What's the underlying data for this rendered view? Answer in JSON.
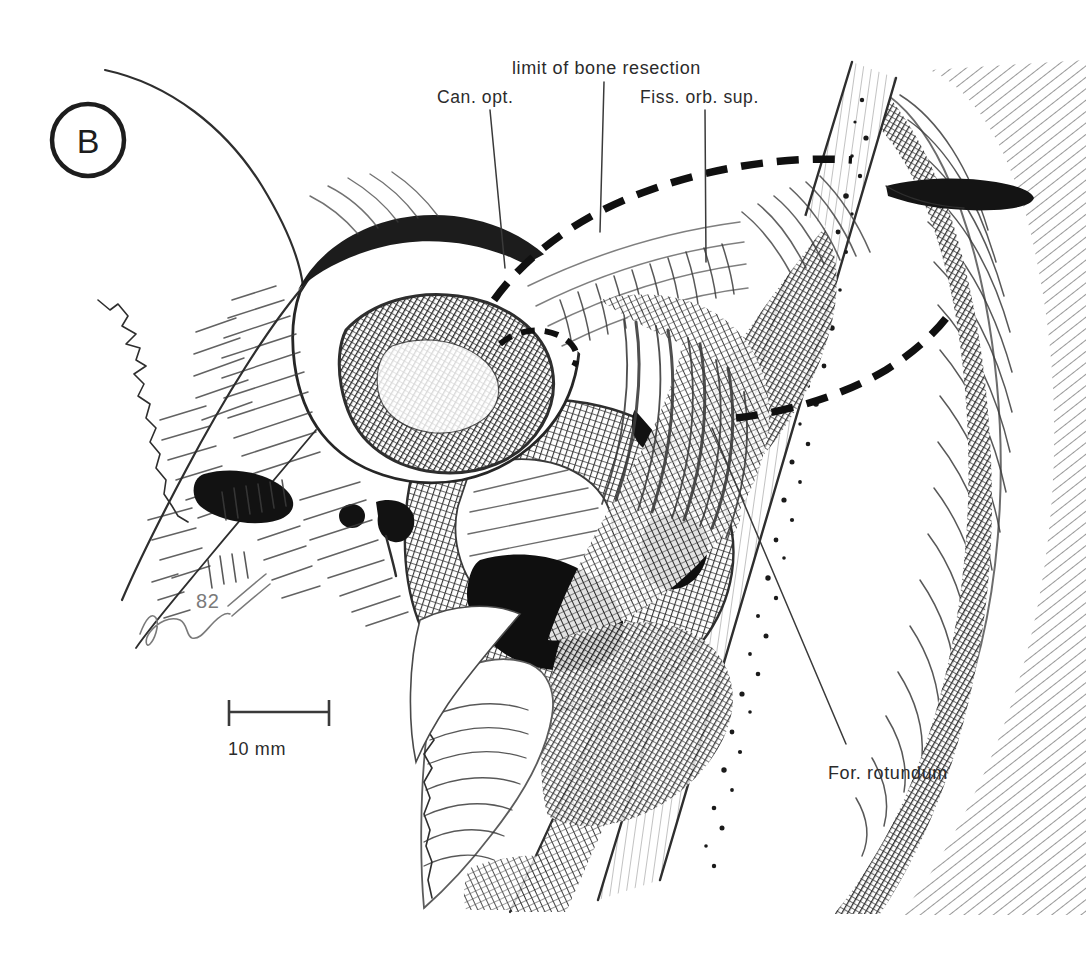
{
  "figure": {
    "panel_letter": "B",
    "type": "anatomical-line-drawing",
    "ink_color": "#1d1d1d",
    "background_color": "#ffffff"
  },
  "labels": {
    "can_opt": "Can. opt.",
    "limit_of_bone_resection": "limit of bone resection",
    "fiss_orb_sup": "Fiss. orb. sup.",
    "for_rotundum": "For. rotundum"
  },
  "scale": {
    "value": "10 mm",
    "bar_length_px": 100
  },
  "signature": {
    "year": "82"
  }
}
